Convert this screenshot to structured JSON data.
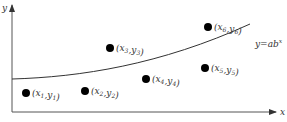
{
  "diagram": {
    "axes": {
      "x_label": "x",
      "y_label": "y",
      "color": "#444444"
    },
    "curve": {
      "equation_base": "y=ab",
      "equation_exponent": "x",
      "color": "#333333"
    },
    "points": [
      {
        "id": "p1",
        "x_sym": "x",
        "x_sub": "1",
        "y_sym": "y",
        "y_sub": "1"
      },
      {
        "id": "p2",
        "x_sym": "x",
        "x_sub": "2",
        "y_sym": "y",
        "y_sub": "2"
      },
      {
        "id": "p3",
        "x_sym": "x",
        "x_sub": "3",
        "y_sym": "y",
        "y_sub": "3"
      },
      {
        "id": "p4",
        "x_sym": "x",
        "x_sub": "4",
        "y_sym": "y",
        "y_sub": "4"
      },
      {
        "id": "p5",
        "x_sym": "x",
        "x_sub": "5",
        "y_sym": "y",
        "y_sub": "5"
      },
      {
        "id": "p6",
        "x_sym": "x",
        "x_sub": "6",
        "y_sym": "y",
        "y_sub": "6"
      }
    ],
    "point_color": "#000000"
  }
}
